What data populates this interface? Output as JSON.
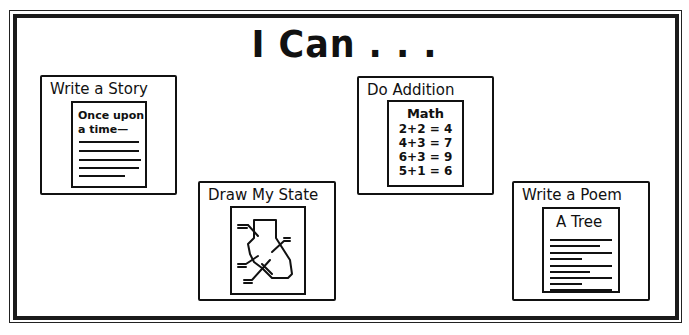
{
  "title": "I Can . . .",
  "cards": [
    {
      "label": "Write a Story",
      "paper": {
        "heading_line1": "Once upon",
        "heading_line2": "a time—",
        "text_lines": 5
      }
    },
    {
      "label": "Do Addition",
      "paper": {
        "heading": "Math",
        "equations": [
          "2+2 = 4",
          "4+3 = 7",
          "6+3 = 9",
          "5+1 = 6"
        ]
      }
    },
    {
      "label": "Draw My State",
      "paper": {
        "drawing": "state-map-outline"
      }
    },
    {
      "label": "Write a Poem",
      "paper": {
        "heading": "A Tree",
        "text_lines": 8
      }
    }
  ],
  "colors": {
    "ink": "#111111",
    "background": "#ffffff"
  }
}
